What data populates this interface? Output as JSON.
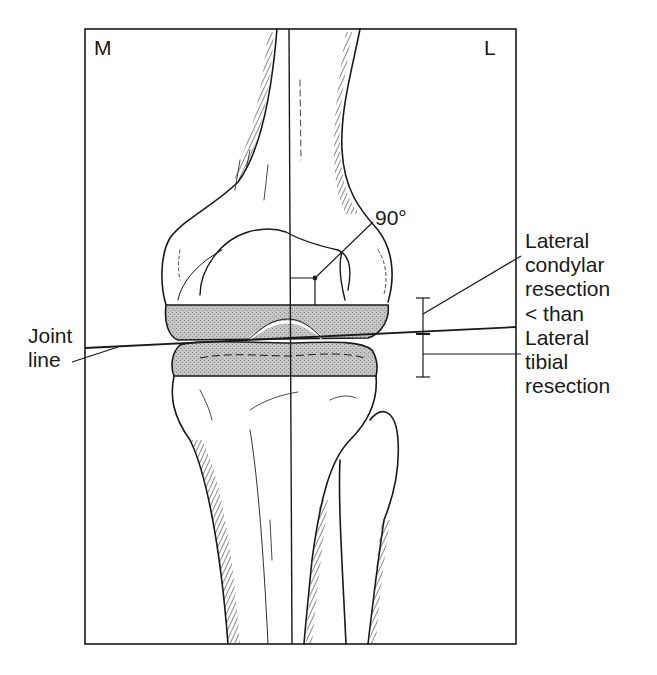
{
  "figure": {
    "type": "anatomical line drawing",
    "frame": {
      "stroke": "#1a1a1a",
      "fill": "#ffffff"
    },
    "resection_fill": "#b3b3b3"
  },
  "labels": {
    "medial": "M",
    "lateral": "L",
    "angle": "90°",
    "joint_line": [
      "Joint",
      "line"
    ],
    "annotation": [
      "Lateral",
      "condylar",
      "resection",
      "< than",
      "Lateral",
      "tibial",
      "resection"
    ]
  }
}
